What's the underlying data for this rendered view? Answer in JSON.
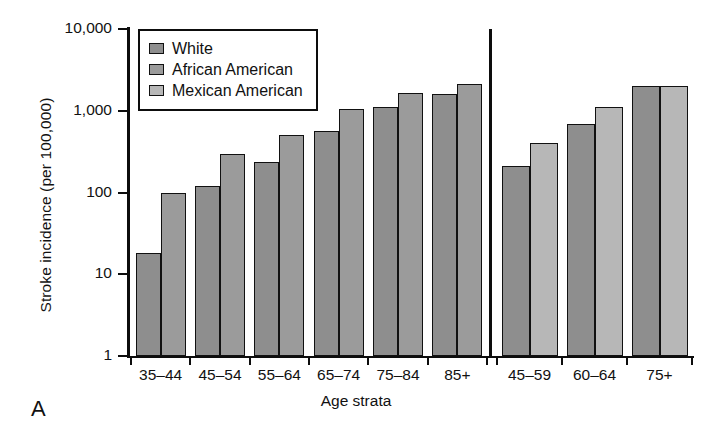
{
  "panel_letter": "A",
  "axes": {
    "ylabel": "Stroke incidence (per 100,000)",
    "xlabel": "Age strata",
    "yticks": [
      "10,000",
      "1,000",
      "100",
      "10",
      "1"
    ]
  },
  "legend": {
    "items": [
      {
        "label": "White",
        "color": "#8e8e8e"
      },
      {
        "label": "African American",
        "color": "#9b9b9b"
      },
      {
        "label": "Mexican American",
        "color": "#b7b7b7"
      }
    ]
  },
  "chart_data": {
    "type": "bar",
    "title": "",
    "xlabel": "Age strata",
    "ylabel": "Stroke incidence (per 100,000)",
    "yscale": "log",
    "ylim": [
      1,
      10000
    ],
    "ytick_values": [
      1,
      10,
      100,
      1000,
      10000
    ],
    "ytick_labels": [
      "1",
      "10",
      "100",
      "1,000",
      "10,000"
    ],
    "grid": false,
    "legend_position": "top-left",
    "panels": [
      {
        "name": "left",
        "categories": [
          "35–44",
          "45–54",
          "55–64",
          "65–74",
          "75–84",
          "85+"
        ],
        "series": [
          {
            "name": "White",
            "color": "#8e8e8e",
            "values": [
              18,
              120,
              235,
              570,
              1130,
              1620
            ]
          },
          {
            "name": "African American",
            "color": "#9b9b9b",
            "values": [
              100,
              300,
              510,
              1050,
              1650,
              2150
            ]
          }
        ]
      },
      {
        "name": "right",
        "categories": [
          "45–59",
          "60–64",
          "75+"
        ],
        "series": [
          {
            "name": "White",
            "color": "#8e8e8e",
            "values": [
              210,
              690,
              2000
            ]
          },
          {
            "name": "Mexican American",
            "color": "#b7b7b7",
            "values": [
              400,
              1130,
              2000
            ]
          }
        ]
      }
    ]
  }
}
